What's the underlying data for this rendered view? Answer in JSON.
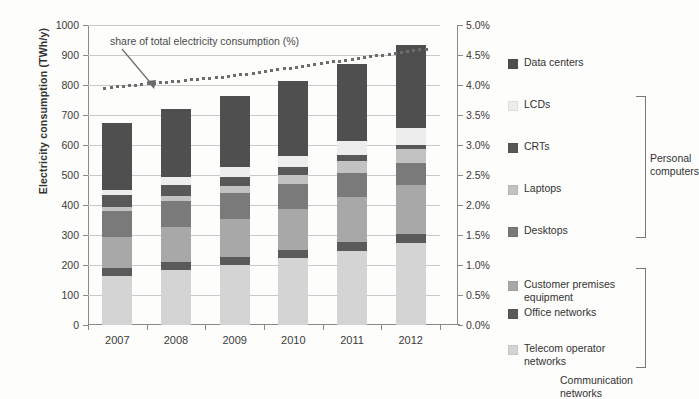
{
  "chart_data": {
    "type": "bar",
    "subtype": "stacked-bar-with-line",
    "title": "",
    "xlabel": "",
    "ylabel": "Electricity consumption (TWh/y)",
    "y2label": "",
    "categories": [
      "2007",
      "2008",
      "2009",
      "2010",
      "2011",
      "2012"
    ],
    "ylim": [
      0,
      1000
    ],
    "yticks": [
      0,
      100,
      200,
      300,
      400,
      500,
      600,
      700,
      800,
      900,
      1000
    ],
    "ytick_labels": [
      "0",
      "100",
      "200",
      "300",
      "400",
      "500",
      "600",
      "700",
      "800",
      "900",
      "1000"
    ],
    "y2lim": [
      0,
      5
    ],
    "y2ticks": [
      0,
      0.5,
      1.0,
      1.5,
      2.0,
      2.5,
      3.0,
      3.5,
      4.0,
      4.5,
      5.0
    ],
    "y2tick_labels": [
      "0.0%",
      "0.5%",
      "1.0%",
      "1.5%",
      "2.0%",
      "2.5%",
      "3.0%",
      "3.5%",
      "4.0%",
      "4.5%",
      "5.0%"
    ],
    "grid": true,
    "legend_position": "right",
    "stack_order_bottom_to_top": [
      "Telecom operator networks",
      "Office networks",
      "Customer premises equipment",
      "Desktops",
      "Laptops",
      "CRTs",
      "LCDs",
      "Data centers"
    ],
    "series": [
      {
        "name": "Telecom operator networks",
        "color": "#d4d4d4",
        "values": [
          163,
          183,
          200,
          222,
          247,
          272
        ]
      },
      {
        "name": "Office networks",
        "color": "#5a5a5a",
        "values": [
          28,
          27,
          28,
          29,
          29,
          30
        ]
      },
      {
        "name": "Customer premises equipment",
        "color": "#a8a8a8",
        "values": [
          101,
          116,
          127,
          137,
          152,
          165
        ]
      },
      {
        "name": "Desktops",
        "color": "#7a7a7a",
        "values": [
          88,
          88,
          86,
          83,
          80,
          72
        ]
      },
      {
        "name": "Laptops",
        "color": "#c2c2c2",
        "values": [
          12,
          17,
          23,
          30,
          38,
          48
        ]
      },
      {
        "name": "CRTs",
        "color": "#585858",
        "values": [
          40,
          36,
          30,
          25,
          20,
          14
        ]
      },
      {
        "name": "LCDs",
        "color": "#ededed",
        "values": [
          18,
          25,
          32,
          39,
          47,
          56
        ]
      },
      {
        "name": "Data centers",
        "color": "#4f4f4f",
        "values": [
          223,
          228,
          239,
          247,
          257,
          275
        ]
      }
    ],
    "line_series": {
      "name": "share of total electricity consumption (%)",
      "axis": "secondary",
      "style": "dotted",
      "color": "#6d6d6d",
      "values": [
        3.95,
        4.05,
        4.15,
        4.3,
        4.45,
        4.6
      ]
    },
    "annotation": {
      "text": "share of total electricity consumption (%)",
      "points_to": "dotted-line"
    }
  },
  "legend": {
    "items": [
      {
        "label": "Data centers",
        "color": "#4f4f4f"
      },
      {
        "label": "LCDs",
        "color": "#ededed"
      },
      {
        "label": "CRTs",
        "color": "#585858"
      },
      {
        "label": "Laptops",
        "color": "#c2c2c2"
      },
      {
        "label": "Desktops",
        "color": "#7a7a7a"
      },
      {
        "label": "Customer premises equipment",
        "color": "#a8a8a8"
      },
      {
        "label": "Office networks",
        "color": "#5a5a5a"
      },
      {
        "label": "Telecom operator networks",
        "color": "#d4d4d4"
      }
    ],
    "groups": [
      {
        "label": "Personal\ncomputers"
      },
      {
        "label": "Communication\nnetworks"
      }
    ]
  }
}
